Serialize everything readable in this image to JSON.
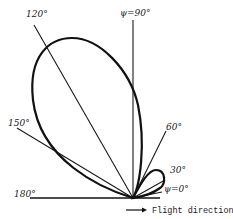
{
  "diagram": {
    "type": "polar-radiation-pattern",
    "origin_px": [
      133,
      198
    ],
    "angle_labels": {
      "a0": "ψ=0°",
      "a30": "30°",
      "a60": "60°",
      "a90": "ψ=90°",
      "a120": "120°",
      "a150": "150°",
      "a180": "180°"
    },
    "rays_deg": [
      0,
      30,
      60,
      90,
      120,
      150,
      180
    ],
    "lobes": [
      {
        "name": "main-lobe",
        "direction_deg_approx": 110,
        "relative_size": "large"
      },
      {
        "name": "minor-lobe",
        "direction_deg_approx": 30,
        "relative_size": "small"
      }
    ],
    "arrow_caption": "Flight direction",
    "colors": {
      "ink": "#111111",
      "background": "#ffffff"
    }
  }
}
